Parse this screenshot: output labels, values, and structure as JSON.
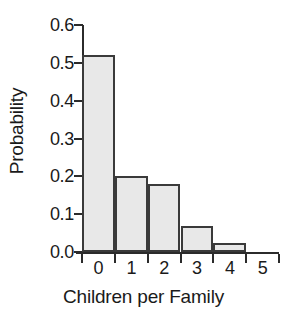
{
  "chart_data": {
    "type": "bar",
    "title": "",
    "xlabel": "Children per Family",
    "ylabel": "Probability",
    "categories": [
      "0",
      "1",
      "2",
      "3",
      "4"
    ],
    "values": [
      0.52,
      0.2,
      0.18,
      0.07,
      0.025
    ],
    "xlim": [
      0,
      6
    ],
    "ylim": [
      0.0,
      0.6
    ],
    "x_tick_labels": [
      "0",
      "1",
      "2",
      "3",
      "4",
      "5",
      "6"
    ],
    "x_tick_values": [
      0,
      1,
      2,
      3,
      4,
      5,
      6
    ],
    "y_tick_labels": [
      "0.0",
      "0.1",
      "0.2",
      "0.3",
      "0.4",
      "0.5",
      "0.6"
    ],
    "y_tick_values": [
      0.0,
      0.1,
      0.2,
      0.3,
      0.4,
      0.5,
      0.6
    ],
    "grid": false,
    "legend": null,
    "bar_fill_color": "#e8e8e8",
    "bar_edge_color": "#3a3a3a",
    "axis_color": "#2b2b2b",
    "background_color": "#ffffff",
    "note": "Histogram-style bars: bin edges align with ticks, labels centered between ticks; bins 5 and 6 are empty."
  }
}
